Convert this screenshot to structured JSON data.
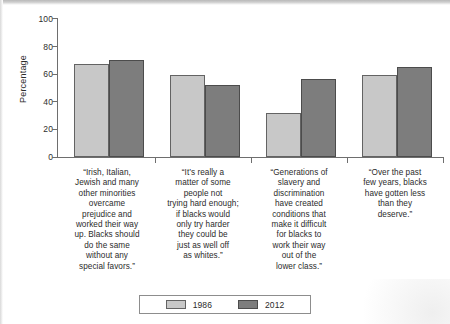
{
  "chart_data": {
    "type": "bar",
    "title": "",
    "subtitle": "",
    "xlabel": "",
    "ylabel": "Percentage",
    "ylim": [
      0,
      100
    ],
    "yticks": [
      0,
      20,
      40,
      60,
      80,
      100
    ],
    "ytick_labels": [
      "0",
      "20",
      "40",
      "60",
      "80",
      "100"
    ],
    "grid": false,
    "legend_position": "bottom-center",
    "categories": [
      "“Irish, Italian, Jewish and many other minorities overcame prejudice and worked their way up. Blacks should do the same without any special favors.”",
      "“It’s really a matter of some people not trying hard enough; if blacks would only try harder they could be just as well off as whites.”",
      "“Generations of slavery and discrimination have created conditions that make it difficult for blacks to work their way out of the lower class.”",
      "“Over the past few years, blacks have gotten less than they deserve.”"
    ],
    "series": [
      {
        "name": "1986",
        "color": "#c8c8c8",
        "values": [
          67,
          59,
          32,
          59
        ]
      },
      {
        "name": "2012",
        "color": "#7d7d7d",
        "values": [
          70,
          52,
          56,
          65
        ]
      }
    ]
  },
  "axis": {
    "y_title": "Percentage",
    "y_tick_labels": [
      "100",
      "80",
      "60",
      "40",
      "20",
      "0"
    ]
  },
  "legend": {
    "entries": [
      {
        "label": "1986"
      },
      {
        "label": "2012"
      }
    ]
  },
  "categories_display": [
    "“Irish, Italian,\nJewish and many\nother minorities\novercame\nprejudice and\nworked their way\nup. Blacks should\ndo the same\nwithout any\nspecial favors.”",
    "“It’s really a\nmatter of some\npeople not\ntrying hard enough;\nif blacks would\nonly try harder\nthey could be\njust as well off\nas whites.”",
    "“Generations of\nslavery and\ndiscrimination\nhave created\nconditions that\nmake it difficult\nfor blacks to\nwork their way\nout of the\nlower class.”",
    "“Over the past\nfew years, blacks\nhave gotten less\nthan they\ndeserve.”"
  ]
}
